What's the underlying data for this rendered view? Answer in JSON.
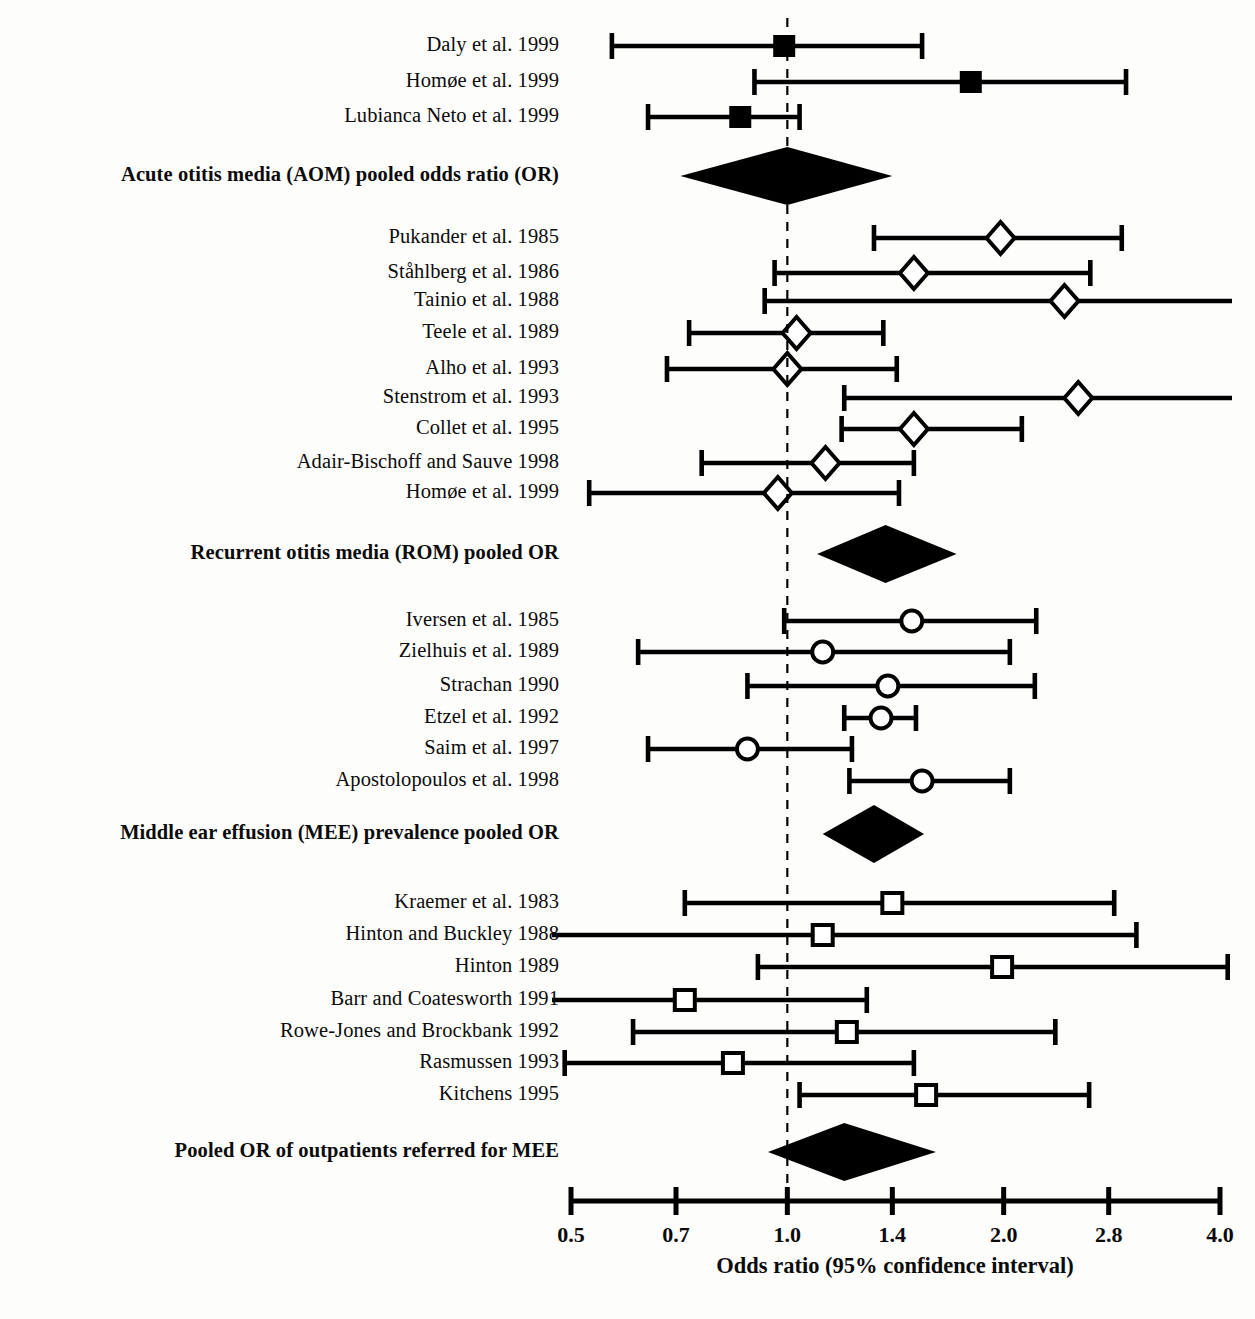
{
  "figure": {
    "type": "forest-plot",
    "axis_title": "Odds ratio (95% confidence interval)",
    "axis_scale": "log",
    "axis_ticks": [
      "0.5",
      "0.7",
      "1.0",
      "1.4",
      "2.0",
      "2.8",
      "4.0"
    ],
    "axis_tick_values": [
      0.5,
      0.7,
      1.0,
      1.4,
      2.0,
      2.8,
      4.0
    ],
    "axis_min": 0.5,
    "axis_max": 4.0,
    "reference_line": 1.0,
    "line_color": "#000000",
    "background_color": "#fdfdfb"
  },
  "chart_data": {
    "type": "forest",
    "title": "",
    "xlabel": "Odds ratio (95% confidence interval)",
    "ylabel": "",
    "xlim": [
      0.5,
      4.0
    ],
    "xscale": "log",
    "xticks": [
      0.5,
      0.7,
      1.0,
      1.4,
      2.0,
      2.8,
      4.0
    ],
    "xticklabels": [
      "0.5",
      "0.7",
      "1.0",
      "1.4",
      "2.0",
      "2.8",
      "4.0"
    ],
    "reference_line": 1.0,
    "grid": false,
    "legend": "none",
    "rows": [
      {
        "label": "Daly et al. 1999",
        "kind": "study",
        "marker": "filled-square",
        "or": 0.99,
        "lo": 0.57,
        "hi": 1.54,
        "y": 46
      },
      {
        "label": "Homøe et al. 1999",
        "kind": "study",
        "marker": "filled-square",
        "or": 1.8,
        "lo": 0.9,
        "hi": 2.96,
        "y": 82
      },
      {
        "label": "Lubianca Neto et al. 1999",
        "kind": "study",
        "marker": "filled-square",
        "or": 0.86,
        "lo": 0.64,
        "hi": 1.04,
        "y": 117
      },
      {
        "label": "Acute otitis media (AOM) pooled odds ratio (OR)",
        "kind": "pooled",
        "marker": "diamond",
        "or": 1.0,
        "lo": 0.71,
        "hi": 1.4,
        "y": 176
      },
      {
        "label": "Pukander et al. 1985",
        "kind": "study",
        "marker": "open-diamond",
        "or": 1.98,
        "lo": 1.32,
        "hi": 2.92,
        "y": 238
      },
      {
        "label": "Ståhlberg et al. 1986",
        "kind": "study",
        "marker": "open-diamond",
        "or": 1.5,
        "lo": 0.96,
        "hi": 2.64,
        "y": 273
      },
      {
        "label": "Tainio et al. 1988",
        "kind": "study",
        "marker": "open-diamond",
        "or": 2.43,
        "lo": 0.93,
        "hi": 4.2,
        "y": 301
      },
      {
        "label": "Teele et al. 1989",
        "kind": "study",
        "marker": "open-diamond",
        "or": 1.03,
        "lo": 0.73,
        "hi": 1.36,
        "y": 333
      },
      {
        "label": "Alho et al. 1993",
        "kind": "study",
        "marker": "open-diamond",
        "or": 1.0,
        "lo": 0.68,
        "hi": 1.42,
        "y": 369
      },
      {
        "label": "Stenstrom et al. 1993",
        "kind": "study",
        "marker": "open-diamond",
        "or": 2.54,
        "lo": 1.2,
        "hi": 4.2,
        "y": 398
      },
      {
        "label": "Collet et al. 1995",
        "kind": "study",
        "marker": "open-diamond",
        "or": 1.5,
        "lo": 1.19,
        "hi": 2.12,
        "y": 429
      },
      {
        "label": "Adair-Bischoff and Sauve 1998",
        "kind": "study",
        "marker": "open-diamond",
        "or": 1.13,
        "lo": 0.76,
        "hi": 1.5,
        "y": 463
      },
      {
        "label": "Homøe et al. 1999",
        "kind": "study",
        "marker": "open-diamond",
        "or": 0.97,
        "lo": 0.53,
        "hi": 1.43,
        "y": 493
      },
      {
        "label": "Recurrent otitis media (ROM) pooled OR",
        "kind": "pooled",
        "marker": "diamond",
        "or": 1.37,
        "lo": 1.1,
        "hi": 1.72,
        "y": 554
      },
      {
        "label": "Iversen et al. 1985",
        "kind": "study",
        "marker": "open-circle",
        "or": 1.49,
        "lo": 0.99,
        "hi": 2.22,
        "y": 621
      },
      {
        "label": "Zielhuis et al. 1989",
        "kind": "study",
        "marker": "open-circle",
        "or": 1.12,
        "lo": 0.62,
        "hi": 2.04,
        "y": 652
      },
      {
        "label": "Strachan 1990",
        "kind": "study",
        "marker": "open-circle",
        "or": 1.38,
        "lo": 0.88,
        "hi": 2.21,
        "y": 686
      },
      {
        "label": "Etzel et al. 1992",
        "kind": "study",
        "marker": "open-circle",
        "or": 1.35,
        "lo": 1.2,
        "hi": 1.51,
        "y": 718
      },
      {
        "label": "Saim et al. 1997",
        "kind": "study",
        "marker": "open-circle",
        "or": 0.88,
        "lo": 0.64,
        "hi": 1.23,
        "y": 749
      },
      {
        "label": "Apostolopoulos et al. 1998",
        "kind": "study",
        "marker": "open-circle",
        "or": 1.54,
        "lo": 1.22,
        "hi": 2.04,
        "y": 781
      },
      {
        "label": "Middle ear effusion (MEE) prevalence pooled OR",
        "kind": "pooled",
        "marker": "diamond",
        "or": 1.32,
        "lo": 1.12,
        "hi": 1.55,
        "y": 834
      },
      {
        "label": "Kraemer et al. 1983",
        "kind": "study",
        "marker": "open-square",
        "or": 1.4,
        "lo": 0.72,
        "hi": 2.85,
        "y": 903
      },
      {
        "label": "Hinton and Buckley 1988",
        "kind": "study",
        "marker": "open-square",
        "or": 1.12,
        "lo": 0.43,
        "hi": 3.06,
        "y": 935
      },
      {
        "label": "Hinton 1989",
        "kind": "study",
        "marker": "open-square",
        "or": 1.99,
        "lo": 0.91,
        "hi": 4.1,
        "y": 967
      },
      {
        "label": "Barr and Coatesworth 1991",
        "kind": "study",
        "marker": "open-square",
        "or": 0.72,
        "lo": 0.42,
        "hi": 1.29,
        "y": 1000
      },
      {
        "label": "Rowe-Jones and Brockbank 1992",
        "kind": "study",
        "marker": "open-square",
        "or": 1.21,
        "lo": 0.61,
        "hi": 2.36,
        "y": 1032
      },
      {
        "label": "Rasmussen 1993",
        "kind": "study",
        "marker": "open-square",
        "or": 0.84,
        "lo": 0.49,
        "hi": 1.5,
        "y": 1063
      },
      {
        "label": "Kitchens 1995",
        "kind": "study",
        "marker": "open-square",
        "or": 1.56,
        "lo": 1.04,
        "hi": 2.63,
        "y": 1095
      },
      {
        "label": "Pooled OR of outpatients referred for MEE",
        "kind": "pooled",
        "marker": "diamond",
        "or": 1.2,
        "lo": 0.94,
        "hi": 1.61,
        "y": 1152
      }
    ]
  }
}
